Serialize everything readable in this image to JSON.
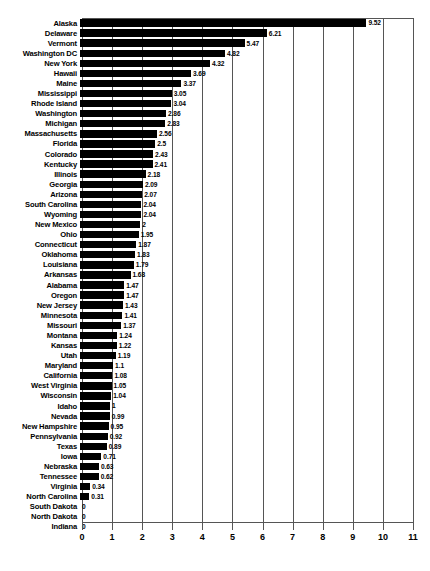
{
  "chart_data": {
    "type": "bar",
    "orientation": "horizontal",
    "title": "",
    "subtitle": "",
    "xlabel": "",
    "ylabel": "",
    "xlim": [
      0,
      11
    ],
    "xticks": [
      "0",
      "1",
      "2",
      "3",
      "4",
      "5",
      "6",
      "7",
      "8",
      "9",
      "10",
      "11"
    ],
    "grid": true,
    "legend": false,
    "bar_color": "#000000",
    "grid_color": "#555555",
    "categories": [
      "Alaska",
      "Delaware",
      "Vermont",
      "Washington DC",
      "New York",
      "Hawaii",
      "Maine",
      "Mississippi",
      "Rhode Island",
      "Washington",
      "Michigan",
      "Massachusetts",
      "Florida",
      "Colorado",
      "Kentucky",
      "Illinois",
      "Georgia",
      "Arizona",
      "South Carolina",
      "Wyoming",
      "New Mexico",
      "Ohio",
      "Connecticut",
      "Oklahoma",
      "Louisiana",
      "Arkansas",
      "Alabama",
      "Oregon",
      "New Jersey",
      "Minnesota",
      "Missouri",
      "Montana",
      "Kansas",
      "Utah",
      "Maryland",
      "California",
      "West Virginia",
      "Wisconsin",
      "Idaho",
      "Nevada",
      "New Hampshire",
      "Pennsylvania",
      "Texas",
      "Iowa",
      "Nebraska",
      "Tennessee",
      "Virginia",
      "North Carolina",
      "South Dakota",
      "North Dakota",
      "Indiana"
    ],
    "values": [
      9.52,
      6.21,
      5.47,
      4.82,
      4.32,
      3.69,
      3.37,
      3.05,
      3.04,
      2.86,
      2.83,
      2.56,
      2.5,
      2.43,
      2.41,
      2.18,
      2.09,
      2.07,
      2.04,
      2.04,
      2,
      1.95,
      1.87,
      1.83,
      1.79,
      1.68,
      1.47,
      1.47,
      1.43,
      1.41,
      1.37,
      1.24,
      1.22,
      1.19,
      1.1,
      1.08,
      1.05,
      1.04,
      1,
      0.99,
      0.95,
      0.92,
      0.89,
      0.71,
      0.63,
      0.62,
      0.34,
      0.31,
      0,
      0,
      0
    ],
    "value_labels": [
      "9.52",
      "6.21",
      "5.47",
      "4.82",
      "4.32",
      "3.69",
      "3.37",
      "3.05",
      "3.04",
      "2.86",
      "2.83",
      "2.56",
      "2.5",
      "2.43",
      "2.41",
      "2.18",
      "2.09",
      "2.07",
      "2.04",
      "2.04",
      "2",
      "1.95",
      "1.87",
      "1.83",
      "1.79",
      "1.68",
      "1.47",
      "1.47",
      "1.43",
      "1.41",
      "1.37",
      "1.24",
      "1.22",
      "1.19",
      "1.1",
      "1.08",
      "1.05",
      "1.04",
      "1",
      "0.99",
      "0.95",
      "0.92",
      "0.89",
      "0.71",
      "0.63",
      "0.62",
      "0.34",
      "0.31",
      "0",
      "0",
      "0"
    ]
  }
}
